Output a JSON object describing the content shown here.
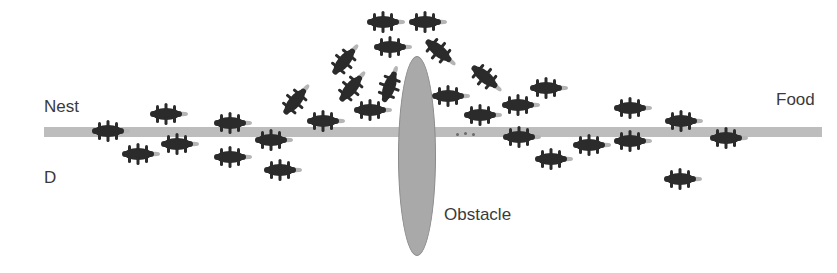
{
  "diagram": {
    "labels": {
      "nest": "Nest",
      "food": "Food",
      "obstacle": "Obstacle",
      "panel": "D"
    },
    "colors": {
      "trail": "#bdbdbd",
      "obstacle": "#a9a9a9",
      "ant_body": "#2b2b2b",
      "ant_head": "#b5b5b5",
      "text": "#3a3a3a"
    },
    "ants": [
      {
        "x": 110,
        "y": 131,
        "rot": 0
      },
      {
        "x": 168,
        "y": 114,
        "rot": 0
      },
      {
        "x": 140,
        "y": 154,
        "rot": 0
      },
      {
        "x": 179,
        "y": 144,
        "rot": 0
      },
      {
        "x": 232,
        "y": 123,
        "rot": 0
      },
      {
        "x": 232,
        "y": 157,
        "rot": 0
      },
      {
        "x": 273,
        "y": 140,
        "rot": 0
      },
      {
        "x": 282,
        "y": 170,
        "rot": 0
      },
      {
        "x": 296,
        "y": 100,
        "rot": -50
      },
      {
        "x": 325,
        "y": 121,
        "rot": 0
      },
      {
        "x": 345,
        "y": 60,
        "rot": -50
      },
      {
        "x": 352,
        "y": 87,
        "rot": -50
      },
      {
        "x": 372,
        "y": 110,
        "rot": 0
      },
      {
        "x": 385,
        "y": 22,
        "rot": 0
      },
      {
        "x": 392,
        "y": 47,
        "rot": 0
      },
      {
        "x": 390,
        "y": 85,
        "rot": -70
      },
      {
        "x": 427,
        "y": 22,
        "rot": 0
      },
      {
        "x": 440,
        "y": 52,
        "rot": 40
      },
      {
        "x": 450,
        "y": 96,
        "rot": 0
      },
      {
        "x": 486,
        "y": 78,
        "rot": 40
      },
      {
        "x": 482,
        "y": 115,
        "rot": 0
      },
      {
        "x": 520,
        "y": 105,
        "rot": 0
      },
      {
        "x": 548,
        "y": 88,
        "rot": 0
      },
      {
        "x": 521,
        "y": 137,
        "rot": 0
      },
      {
        "x": 553,
        "y": 159,
        "rot": 0
      },
      {
        "x": 591,
        "y": 145,
        "rot": 0
      },
      {
        "x": 632,
        "y": 108,
        "rot": 0
      },
      {
        "x": 632,
        "y": 141,
        "rot": 0
      },
      {
        "x": 683,
        "y": 121,
        "rot": 0
      },
      {
        "x": 682,
        "y": 179,
        "rot": 0
      },
      {
        "x": 728,
        "y": 138,
        "rot": 0
      }
    ],
    "pheromone_dots": [
      {
        "x": 456,
        "y": 133
      },
      {
        "x": 464,
        "y": 132
      },
      {
        "x": 472,
        "y": 133
      }
    ]
  }
}
